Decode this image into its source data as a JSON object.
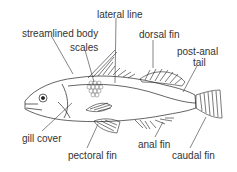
{
  "diagram": {
    "labels": {
      "lateral_line": "lateral line",
      "streamlined_body": "streamlined body",
      "scales": "scales",
      "dorsal_fin": "dorsal fin",
      "post_anal_tail_1": "post-anal",
      "post_anal_tail_2": "tail",
      "gill_cover": "gill cover",
      "pectoral_fin": "pectoral fin",
      "anal_fin": "anal fin",
      "caudal_fin": "caudal fin"
    },
    "colors": {
      "line": "#222222",
      "text": "#333333",
      "background": "#ffffff"
    }
  }
}
